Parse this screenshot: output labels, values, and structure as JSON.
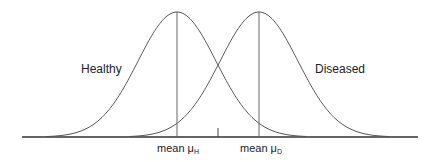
{
  "labels": {
    "healthy": "Healthy",
    "diseased": "Diseased",
    "mean_h": "mean μ",
    "mean_h_sub": "H",
    "mean_d": "mean μ",
    "mean_d_sub": "D"
  },
  "colors": {
    "line": "#555555",
    "axis": "#333333",
    "text": "#222222"
  },
  "chart_data": {
    "type": "line",
    "title": "",
    "series": [
      {
        "name": "Healthy",
        "mean_px": 177,
        "sigma_px": 39,
        "peak_px": 12
      },
      {
        "name": "Diseased",
        "mean_px": 259,
        "sigma_px": 39,
        "peak_px": 12
      }
    ],
    "annotations": [
      "mean μH",
      "mean μD",
      "threshold tick between means"
    ],
    "xlabel": "",
    "ylabel": "",
    "grid": false
  }
}
